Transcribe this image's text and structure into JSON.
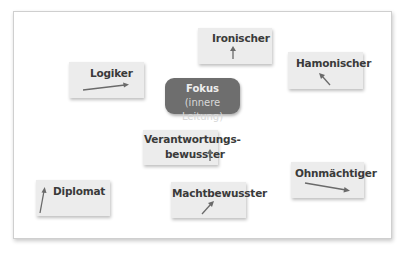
{
  "diagram": {
    "center": {
      "title": "Fokus",
      "subtitle": "(innere Leitung)",
      "color": "#6e6e6e"
    },
    "nodes": [
      {
        "id": "ironischer",
        "label": "Ironischer",
        "arrow": "up"
      },
      {
        "id": "hamonischer",
        "label": "Hamonischer",
        "arrow": "up-left"
      },
      {
        "id": "logiker",
        "label": "Logiker",
        "arrow": "right"
      },
      {
        "id": "verantwortungsbewusster",
        "label_line1": "Verantwortungs-",
        "label_line2": "bewusster",
        "arrow": "up"
      },
      {
        "id": "ohnmaechtiger",
        "label": "Ohnmächtiger",
        "arrow": "right-down"
      },
      {
        "id": "diplomat",
        "label": "Diplomat",
        "arrow": "up"
      },
      {
        "id": "machtbewusster",
        "label": "Machtbewusster",
        "arrow": "up-right"
      }
    ],
    "box_color": "#ececec",
    "arrow_color": "#6a6a6a"
  }
}
